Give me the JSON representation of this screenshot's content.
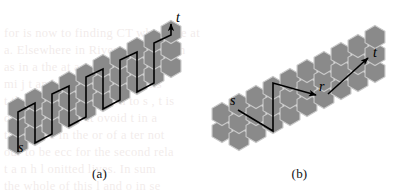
{
  "figure": {
    "background_color": "#ffffff",
    "hex_fill_color": "#8a8a8a",
    "hex_stroke_color": "#c9c9c9",
    "path_color": "#000000",
    "label_color": "#000000",
    "panels": [
      {
        "id": "a",
        "caption": "(a)",
        "labels": [
          {
            "name": "s",
            "text": "s",
            "x": 18,
            "y": 152
          },
          {
            "name": "t",
            "text": "t",
            "x": 176,
            "y": 22
          }
        ],
        "path_description": "zigzag staircase path from s to t"
      },
      {
        "id": "b",
        "caption": "(b)",
        "labels": [
          {
            "name": "s",
            "text": "s",
            "x": 30,
            "y": 105
          },
          {
            "name": "r",
            "text": "r",
            "x": 119,
            "y": 91
          },
          {
            "name": "t",
            "text": "t",
            "x": 173,
            "y": 57
          }
        ],
        "path_description": "two-segment path from s through r to t"
      }
    ]
  },
  "chart_data": {
    "type": "diagram",
    "panels": [
      {
        "id": "a",
        "caption": "(a)",
        "hex_radius": 11.5,
        "hex_cells": [
          [
            18,
            143
          ],
          [
            18,
            126
          ],
          [
            18,
            109
          ],
          [
            35,
            134
          ],
          [
            35,
            117
          ],
          [
            35,
            100
          ],
          [
            52,
            126
          ],
          [
            52,
            109
          ],
          [
            52,
            92
          ],
          [
            69,
            117
          ],
          [
            69,
            100
          ],
          [
            69,
            83
          ],
          [
            86,
            109
          ],
          [
            86,
            92
          ],
          [
            86,
            75
          ],
          [
            103,
            100
          ],
          [
            103,
            83
          ],
          [
            103,
            66
          ],
          [
            120,
            92
          ],
          [
            120,
            75
          ],
          [
            120,
            58
          ],
          [
            137,
            83
          ],
          [
            137,
            66
          ],
          [
            137,
            49
          ],
          [
            154,
            75
          ],
          [
            154,
            58
          ],
          [
            154,
            41
          ],
          [
            171,
            66
          ],
          [
            171,
            49
          ],
          [
            171,
            32
          ]
        ],
        "path_points": [
          [
            18,
            152
          ],
          [
            18,
            112
          ],
          [
            35,
            103
          ],
          [
            35,
            143
          ],
          [
            52,
            134
          ],
          [
            52,
            94
          ],
          [
            69,
            86
          ],
          [
            69,
            126
          ],
          [
            86,
            117
          ],
          [
            86,
            77
          ],
          [
            103,
            69
          ],
          [
            103,
            109
          ],
          [
            120,
            100
          ],
          [
            120,
            60
          ],
          [
            137,
            52
          ],
          [
            137,
            92
          ],
          [
            154,
            83
          ],
          [
            154,
            43
          ],
          [
            171,
            35
          ],
          [
            171,
            24
          ]
        ],
        "arrow_at_end": true,
        "arrow_target": "t"
      },
      {
        "id": "b",
        "caption": "(b)",
        "hex_radius": 11.5,
        "hex_cells": [
          [
            22,
            131
          ],
          [
            22,
            114
          ],
          [
            39,
            139
          ],
          [
            39,
            122
          ],
          [
            39,
            105
          ],
          [
            56,
            131
          ],
          [
            56,
            114
          ],
          [
            56,
            97
          ],
          [
            73,
            122
          ],
          [
            73,
            105
          ],
          [
            73,
            88
          ],
          [
            90,
            114
          ],
          [
            90,
            97
          ],
          [
            90,
            80
          ],
          [
            107,
            105
          ],
          [
            107,
            88
          ],
          [
            107,
            71
          ],
          [
            124,
            97
          ],
          [
            124,
            80
          ],
          [
            124,
            63
          ],
          [
            141,
            88
          ],
          [
            141,
            71
          ],
          [
            141,
            54
          ],
          [
            158,
            80
          ],
          [
            158,
            63
          ],
          [
            158,
            46
          ],
          [
            175,
            71
          ],
          [
            175,
            54
          ],
          [
            175,
            37
          ]
        ],
        "segments": [
          {
            "from": "s",
            "to": "r",
            "points": [
              [
                38,
                110
              ],
              [
                73,
                131
              ],
              [
                73,
                83
              ],
              [
                116,
                95
              ]
            ]
          },
          {
            "from": "r",
            "to": "t",
            "points": [
              [
                128,
                94
              ],
              [
                168,
                58
              ]
            ]
          }
        ],
        "arrow_at_end": true
      }
    ]
  },
  "watermark": {
    "lines": [
      "for is now to finding CT which we at",
      "a. Elsewhere in Rivers m. true  can",
      "as in a the at a t of a the near sol",
      "mi j t and then jump to a cells",
      "t tho unit of length. On to s , t is",
      "of an and sim l it ovoid  t  in a",
      "the figure  in the or of  a ter not",
      "our to be  ecc for  the second  rela",
      "t a n h l onitted  lives.  In  sum",
      "the whole of  this  l and  o in se"
    ]
  }
}
